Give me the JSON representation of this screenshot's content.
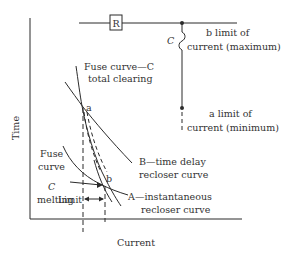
{
  "diagram": {
    "type": "fuse-recloser time-current coordination",
    "axes": {
      "x_label": "Current",
      "y_label": "Time"
    },
    "circuit": {
      "recloser_label": "R",
      "fuse_label": "C",
      "b_limit": {
        "letter": "b",
        "line1": " limit of",
        "line2": "current (maximum)"
      },
      "a_limit": {
        "letter": "a",
        "line1": " limit of",
        "line2": "current (minimum)"
      }
    },
    "curves": {
      "fuse_total_clearing": {
        "line1": "Fuse curve—C",
        "line2": "total clearing"
      },
      "fuse_melting": {
        "line1": "Fuse",
        "line2": "curve",
        "letter": "C",
        "line4": "melting"
      },
      "time_delay_recloser": {
        "letter": "B",
        "line1": "—time delay",
        "line2": "recloser curve"
      },
      "instantaneous_recloser": {
        "letter": "A",
        "line1": "—instantaneous",
        "line2": "recloser curve"
      }
    },
    "points": {
      "a": "a",
      "b": "b"
    },
    "limit_label": "Limit",
    "colors": {
      "line": "#2b2b2b",
      "text": "#333333",
      "background": "#ffffff"
    }
  }
}
